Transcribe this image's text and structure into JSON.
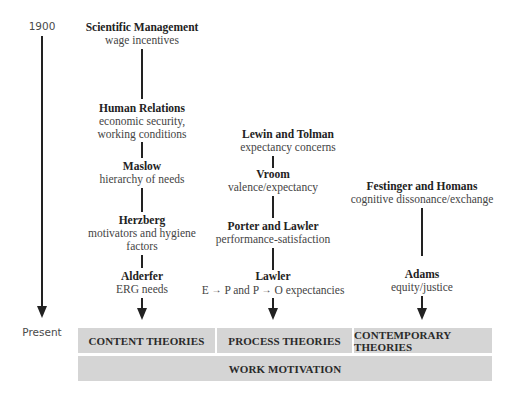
{
  "timeline": {
    "start_label": "1900",
    "end_label": "Present"
  },
  "columns": {
    "content": {
      "nodes": [
        {
          "title": "Scientific Management",
          "desc": [
            "wage incentives"
          ]
        },
        {
          "title": "Human Relations",
          "desc": [
            "economic security,",
            "working conditions"
          ]
        },
        {
          "title": "Maslow",
          "desc": [
            "hierarchy of needs"
          ]
        },
        {
          "title": "Herzberg",
          "desc": [
            "motivators and hygiene",
            "factors"
          ]
        },
        {
          "title": "Alderfer",
          "desc": [
            "ERG needs"
          ]
        }
      ],
      "category": "CONTENT THEORIES"
    },
    "process": {
      "nodes": [
        {
          "title": "Lewin and Tolman",
          "desc": [
            "expectancy concerns"
          ]
        },
        {
          "title": "Vroom",
          "desc": [
            "valence/expectancy"
          ]
        },
        {
          "title": "Porter and Lawler",
          "desc": [
            "performance-satisfaction"
          ]
        },
        {
          "title": "Lawler",
          "desc_parts": [
            "E",
            "P and P",
            "O expectancies"
          ]
        }
      ],
      "category": "PROCESS THEORIES"
    },
    "contemporary": {
      "nodes": [
        {
          "title": "Festinger and Homans",
          "desc": [
            "cognitive dissonance/exchange"
          ]
        },
        {
          "title": "Adams",
          "desc": [
            "equity/justice"
          ]
        }
      ],
      "category": "CONTEMPORARY THEORIES"
    }
  },
  "footer": {
    "label": "WORK MOTIVATION"
  },
  "icons": {
    "inline_arrow": "→"
  },
  "colors": {
    "bar_fill": "#d5d5d5",
    "line": "#222222"
  }
}
